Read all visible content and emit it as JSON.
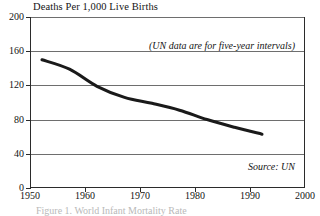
{
  "chart_data": {
    "type": "line",
    "title": "Deaths Per 1,000 Live Births",
    "xlabel": "",
    "ylabel": "",
    "xlim": [
      1950,
      2000
    ],
    "ylim": [
      0,
      200
    ],
    "grid": true,
    "legend": "none",
    "x_ticks": [
      1950,
      1960,
      1970,
      1980,
      1990,
      2000
    ],
    "y_ticks": [
      0,
      40,
      80,
      120,
      160,
      200
    ],
    "annotations": [
      "(UN data are for five-year intervals)",
      "Source: UN"
    ],
    "series": [
      {
        "name": "Infant mortality rate",
        "x": [
          1952,
          1957,
          1962,
          1967,
          1972,
          1977,
          1982,
          1987,
          1992
        ],
        "values": [
          150,
          139,
          119,
          106,
          99,
          91,
          80,
          71,
          63
        ]
      }
    ]
  },
  "chart": {
    "title": "Deaths Per 1,000 Live Births",
    "interval_note": "(UN data are for five-year intervals)",
    "source_note": "Source: UN",
    "caption": "Figure 1. World Infant Mortality Rate",
    "colors": {
      "line": "#1a1a1a",
      "grid": "#6e6e6e",
      "axis": "#2b2b2b",
      "background": "#ffffff"
    }
  }
}
